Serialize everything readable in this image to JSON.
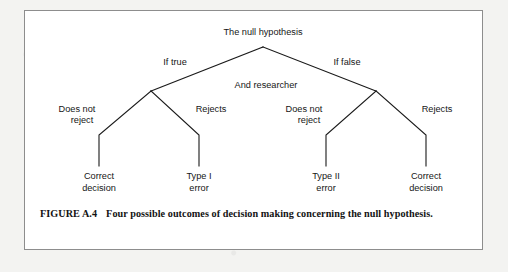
{
  "figure": {
    "caption_label": "FIGURE A.4",
    "caption_text": "Four possible outcomes of decision making concerning the null hypothesis.",
    "border_color": "#8d8d8d",
    "page_background": "#f3f3f1",
    "panel_background": "#ffffff",
    "line_color": "#1a1a1a",
    "text_color": "#161616"
  },
  "tree": {
    "type": "decision-tree",
    "root": {
      "label": "The null hypothesis",
      "x": 238,
      "y": 22
    },
    "level1": [
      {
        "label": "If true",
        "x": 150,
        "y": 52,
        "anchor": "middle"
      },
      {
        "label": "If false",
        "x": 322,
        "y": 52,
        "anchor": "middle"
      }
    ],
    "middle_label": {
      "label": "And researcher",
      "x": 241,
      "y": 75
    },
    "level2": [
      {
        "label_line1": "Does not",
        "label_line2": "reject",
        "x": 52,
        "y": 104,
        "anchor": "middle"
      },
      {
        "label_line1": "Rejects",
        "label_line2": "",
        "x": 186,
        "y": 104,
        "anchor": "middle"
      },
      {
        "label_line1": "Does not",
        "label_line2": "reject",
        "x": 279,
        "y": 104,
        "anchor": "middle"
      },
      {
        "label_line1": "Rejects",
        "label_line2": "",
        "x": 412,
        "y": 104,
        "anchor": "middle"
      }
    ],
    "leaves": [
      {
        "label_line1": "Correct",
        "label_line2": "decision",
        "x": 74,
        "y": 163
      },
      {
        "label_line1": "Type I",
        "label_line2": "error",
        "x": 174,
        "y": 163
      },
      {
        "label_line1": "Type II",
        "label_line2": "error",
        "x": 301,
        "y": 163
      },
      {
        "label_line1": "Correct",
        "label_line2": "decision",
        "x": 401,
        "y": 163
      }
    ],
    "edges": [
      {
        "name": "root-to-left-branch",
        "points": "238,36 126,80"
      },
      {
        "name": "root-to-right-branch",
        "points": "238,36 351,80"
      },
      {
        "name": "left-branch-to-does-not-reject",
        "points": "126,80 74,124 74,155"
      },
      {
        "name": "left-branch-to-rejects",
        "points": "126,80 174,124 174,155"
      },
      {
        "name": "right-branch-to-does-not-reject",
        "points": "351,80 301,124 301,155"
      },
      {
        "name": "right-branch-to-rejects",
        "points": "351,80 401,124 401,155"
      }
    ]
  }
}
